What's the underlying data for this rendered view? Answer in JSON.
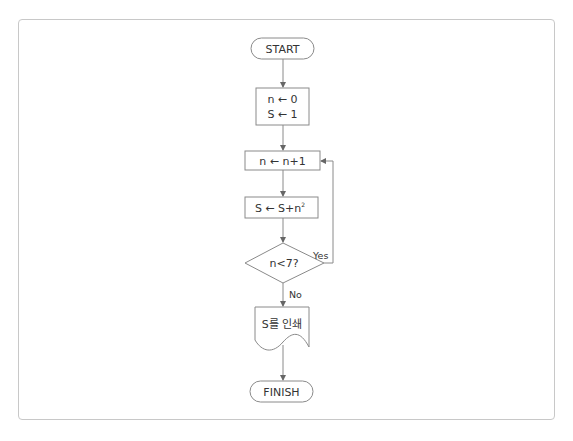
{
  "diagram": {
    "type": "flowchart",
    "nodes": {
      "start": {
        "shape": "terminator",
        "label": "START"
      },
      "init": {
        "shape": "process",
        "lines": [
          "n ← 0",
          "S ← 1"
        ]
      },
      "increment": {
        "shape": "process",
        "label": "n ← n+1"
      },
      "accumulate": {
        "shape": "process",
        "label": "S ← S+n²",
        "label_base": "S ← S+n",
        "label_sup": "2"
      },
      "condition": {
        "shape": "decision",
        "label": "n<7?"
      },
      "output": {
        "shape": "document",
        "label": "S를 인쇄"
      },
      "finish": {
        "shape": "terminator",
        "label": "FINISH"
      }
    },
    "edges": [
      {
        "from": "start",
        "to": "init"
      },
      {
        "from": "init",
        "to": "increment"
      },
      {
        "from": "increment",
        "to": "accumulate"
      },
      {
        "from": "accumulate",
        "to": "condition"
      },
      {
        "from": "condition",
        "to": "increment",
        "label": "Yes"
      },
      {
        "from": "condition",
        "to": "output",
        "label": "No"
      },
      {
        "from": "output",
        "to": "finish"
      }
    ],
    "labels": {
      "yes": "Yes",
      "no": "No"
    }
  },
  "colors": {
    "stroke": "#8a8a8a",
    "frame": "#c8c8c8",
    "text": "#333333"
  }
}
